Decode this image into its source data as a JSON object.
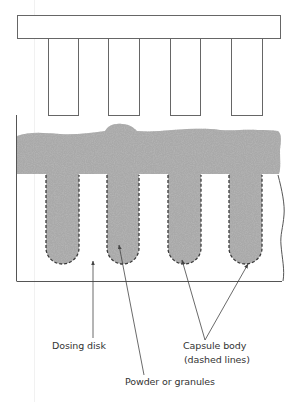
{
  "diagram": {
    "labels": {
      "dosing_disk": "Dosing disk",
      "powder": "Powder or granules",
      "capsule_line1": "Capsule body",
      "capsule_line2": "(dashed lines)"
    },
    "colors": {
      "line": "#555555",
      "powder": "#a9a9a9",
      "powder_dark": "#7d7d7d",
      "powder_light": "#d2d2d2",
      "text": "#333333"
    },
    "tamping_pins": 4,
    "capsule_bodies": 4
  }
}
